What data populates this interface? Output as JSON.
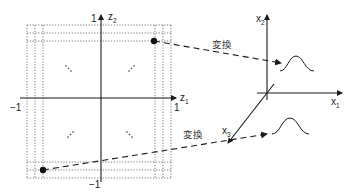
{
  "latent_space": {
    "axis_horizontal": {
      "name": "z",
      "subscript": "1"
    },
    "axis_vertical": {
      "name": "z",
      "subscript": "2"
    },
    "tick_top": "1",
    "tick_bottom": "−1",
    "tick_left": "−1",
    "tick_right": "1",
    "points": [
      {
        "id": "upper-right-sample",
        "x": 154,
        "y": 41
      },
      {
        "id": "lower-left-sample",
        "x": 43,
        "y": 170
      }
    ]
  },
  "data_space": {
    "axis_x1": {
      "name": "x",
      "subscript": "1"
    },
    "axis_x2": {
      "name": "x",
      "subscript": "2"
    },
    "axis_x3": {
      "name": "x",
      "subscript": "3"
    }
  },
  "arrows": [
    {
      "label": "変換",
      "from": "upper-right-sample",
      "to": "upper-gaussian"
    },
    {
      "label": "変換",
      "from": "lower-left-sample",
      "to": "lower-gaussian"
    }
  ],
  "colors": {
    "ink": "#1a1a1a",
    "dotted": "#555555",
    "background": "#ffffff"
  }
}
